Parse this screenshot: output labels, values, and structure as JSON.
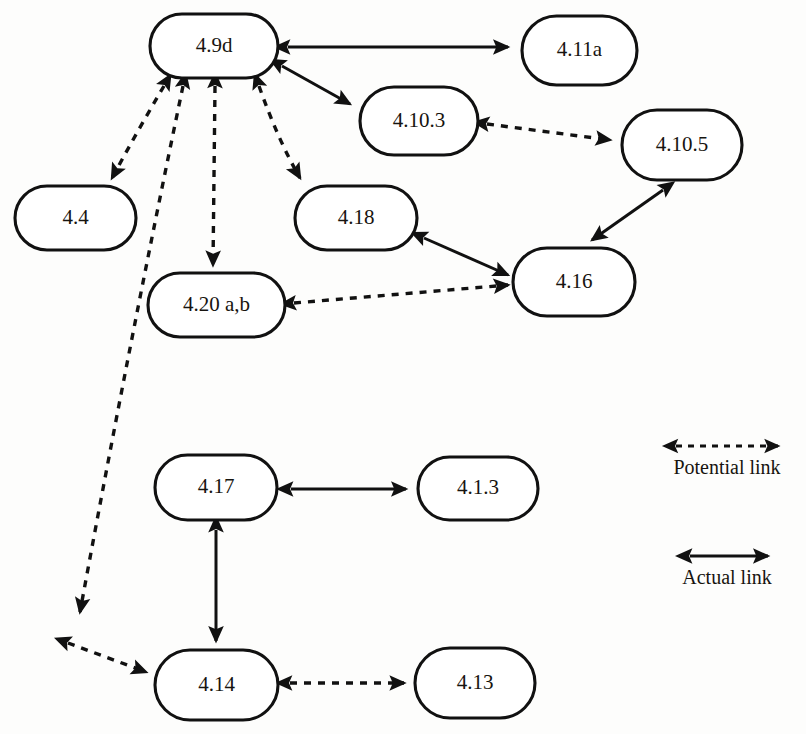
{
  "diagram": {
    "background_color": "#fdfdfc",
    "line_color": "#111111",
    "node_fill": "#ffffff"
  },
  "nodes": [
    {
      "id": "n_4_9d",
      "label": "4.9d",
      "x": 150,
      "y": 14,
      "w": 128,
      "h": 64
    },
    {
      "id": "n_4_11a",
      "label": "4.11a",
      "x": 522,
      "y": 16,
      "w": 115,
      "h": 69
    },
    {
      "id": "n_4_10_3",
      "label": "4.10.3",
      "x": 360,
      "y": 87,
      "w": 118,
      "h": 68
    },
    {
      "id": "n_4_10_5",
      "label": "4.10.5",
      "x": 622,
      "y": 110,
      "w": 120,
      "h": 70
    },
    {
      "id": "n_4_4",
      "label": "4.4",
      "x": 15,
      "y": 186,
      "w": 121,
      "h": 64
    },
    {
      "id": "n_4_18",
      "label": "4.18",
      "x": 295,
      "y": 186,
      "w": 122,
      "h": 64
    },
    {
      "id": "n_4_16",
      "label": "4.16",
      "x": 513,
      "y": 248,
      "w": 122,
      "h": 68
    },
    {
      "id": "n_4_20ab",
      "label": "4.20 a,b",
      "x": 148,
      "y": 273,
      "w": 137,
      "h": 64
    },
    {
      "id": "n_4_17",
      "label": "4.17",
      "x": 155,
      "y": 455,
      "w": 122,
      "h": 65
    },
    {
      "id": "n_4_1_3",
      "label": "4.1.3",
      "x": 418,
      "y": 457,
      "w": 120,
      "h": 63
    },
    {
      "id": "n_4_14",
      "label": "4.14",
      "x": 155,
      "y": 650,
      "w": 123,
      "h": 70
    },
    {
      "id": "n_4_13",
      "label": "4.13",
      "x": 415,
      "y": 648,
      "w": 120,
      "h": 70
    }
  ],
  "edges": [
    {
      "id": "e1",
      "from": "4.9d",
      "to": "4.11a",
      "kind": "actual",
      "arrows": "both",
      "path": "M 288 47 L 508 47"
    },
    {
      "id": "e2",
      "from": "4.9d",
      "to": "4.10.3",
      "kind": "actual",
      "arrows": "both",
      "path": "M 282 66 L 350 104"
    },
    {
      "id": "e3",
      "from": "4.10.3",
      "to": "4.10.5",
      "kind": "potential",
      "arrows": "both",
      "path": "M 487 124 L 610 140"
    },
    {
      "id": "e4",
      "from": "4.10.5",
      "to": "4.16",
      "kind": "actual",
      "arrows": "both",
      "path": "M 663 190 L 592 240"
    },
    {
      "id": "e5",
      "from": "4.18",
      "to": "4.16",
      "kind": "actual",
      "arrows": "both",
      "path": "M 424 238 L 508 275"
    },
    {
      "id": "e6",
      "from": "4.20 a,b",
      "to": "4.16",
      "kind": "potential",
      "arrows": "both",
      "path": "M 294 303 L 508 285"
    },
    {
      "id": "e7",
      "from": "4.9d",
      "to": "4.4",
      "kind": "potential",
      "arrows": "both",
      "path": "M 164 86 Q 138 130 112 178"
    },
    {
      "id": "e8",
      "from": "4.9d",
      "to": "4.20 a,b",
      "kind": "potential",
      "arrows": "both",
      "path": "M 215 86 L 213 265"
    },
    {
      "id": "e9",
      "from": "4.9d",
      "to": "4.18",
      "kind": "potential",
      "arrows": "both",
      "path": "M 259 86 Q 278 140 300 178"
    },
    {
      "id": "e10",
      "from": "4.9d",
      "to": "bottom-left-terminus",
      "kind": "potential",
      "arrows": "both",
      "path": "M 183 86 Q 130 340 80 612"
    },
    {
      "id": "e11",
      "from": "bottom-left-terminus",
      "to": "4.14",
      "kind": "potential",
      "arrows": "both",
      "path": "M 68 643 L 146 672"
    },
    {
      "id": "e12",
      "from": "4.17",
      "to": "4.1.3",
      "kind": "actual",
      "arrows": "both",
      "path": "M 291 489 L 406 489"
    },
    {
      "id": "e13",
      "from": "4.17",
      "to": "4.14",
      "kind": "actual",
      "arrows": "both",
      "path": "M 216 530 L 216 641"
    },
    {
      "id": "e14",
      "from": "4.14",
      "to": "4.13",
      "kind": "potential",
      "arrows": "both",
      "path": "M 290 683 L 404 683"
    }
  ],
  "legend": {
    "items": [
      {
        "id": "legend_potential",
        "label": "Potential link",
        "kind": "potential",
        "line": {
          "x1": 676,
          "y1": 446,
          "x2": 778,
          "y2": 446
        },
        "text_x": 727,
        "text_y": 474
      },
      {
        "id": "legend_actual",
        "label": "Actual link",
        "kind": "actual",
        "line": {
          "x1": 690,
          "y1": 556,
          "x2": 768,
          "y2": 556
        },
        "text_x": 727,
        "text_y": 584
      }
    ]
  }
}
